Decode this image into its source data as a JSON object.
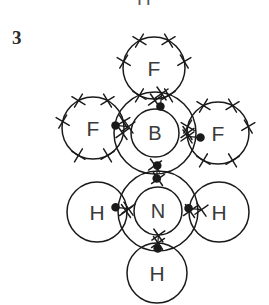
{
  "figure": {
    "kind": "dot-and-cross-diagram",
    "molecule_label": "F3B-NH3 adduct",
    "question_number": "3",
    "clipped_label_above": "H",
    "stroke_color": "#1a1a1a",
    "text_color": "#3a3a3a",
    "background_color": "#ffffff",
    "atoms": [
      {
        "id": "f-top",
        "symbol": "F",
        "cx": 154,
        "cy": 68,
        "r": 31,
        "electron_marker": "cross",
        "outer_cross_count": 6,
        "has_inner_shell": false,
        "bonded_to": [
          "b-center"
        ]
      },
      {
        "id": "f-left",
        "symbol": "F",
        "cx": 93,
        "cy": 128,
        "r": 31,
        "electron_marker": "cross",
        "outer_cross_count": 6,
        "has_inner_shell": false,
        "bonded_to": [
          "b-center"
        ]
      },
      {
        "id": "b-center",
        "symbol": "B",
        "cx": 155,
        "cy": 133,
        "r": 41,
        "inner_r": 24,
        "electron_marker": "cross",
        "outer_cross_count": 4,
        "has_inner_shell": true,
        "bonded_to": [
          "f-top",
          "f-left",
          "f-right",
          "n-center"
        ]
      },
      {
        "id": "f-right",
        "symbol": "F",
        "cx": 218,
        "cy": 133,
        "r": 31,
        "electron_marker": "cross",
        "outer_cross_count": 6,
        "has_inner_shell": false,
        "bonded_to": [
          "b-center"
        ]
      },
      {
        "id": "h-left",
        "symbol": "H",
        "cx": 97,
        "cy": 212,
        "r": 30,
        "electron_marker": "dot",
        "outer_cross_count": 0,
        "has_inner_shell": false,
        "bonded_to": [
          "n-center"
        ]
      },
      {
        "id": "n-center",
        "symbol": "N",
        "cx": 158,
        "cy": 211,
        "r": 40,
        "inner_r": 24,
        "electron_marker": "cross",
        "outer_cross_count": 4,
        "has_inner_shell": true,
        "bonded_to": [
          "b-center",
          "h-left",
          "h-right",
          "h-bottom"
        ]
      },
      {
        "id": "h-right",
        "symbol": "H",
        "cx": 219,
        "cy": 212,
        "r": 30,
        "electron_marker": "dot",
        "outer_cross_count": 0,
        "has_inner_shell": false,
        "bonded_to": [
          "n-center"
        ]
      },
      {
        "id": "h-bottom",
        "symbol": "H",
        "cx": 157,
        "cy": 273,
        "r": 30,
        "electron_marker": "dot",
        "outer_cross_count": 0,
        "has_inner_shell": false,
        "bonded_to": [
          "n-center"
        ]
      }
    ],
    "bonds": [
      {
        "id": "bond-b-f-top",
        "from": "b-center",
        "to": "f-top",
        "x": 161,
        "y": 100,
        "angle": 95,
        "left_marker": "cross",
        "right_marker": "dot"
      },
      {
        "id": "bond-b-f-left",
        "from": "b-center",
        "to": "f-left",
        "x": 122,
        "y": 126,
        "angle": 5,
        "left_marker": "dot",
        "right_marker": "cross"
      },
      {
        "id": "bond-b-f-right",
        "from": "b-center",
        "to": "f-right",
        "x": 194,
        "y": 137,
        "angle": 5,
        "left_marker": "cross",
        "right_marker": "dot"
      },
      {
        "id": "bond-b-n",
        "from": "n-center",
        "to": "b-center",
        "x": 157,
        "y": 172,
        "angle": 92,
        "left_marker": "dot",
        "right_marker": "dot"
      },
      {
        "id": "bond-n-h-left",
        "from": "n-center",
        "to": "h-left",
        "x": 122,
        "y": 208,
        "angle": 6,
        "left_marker": "dot",
        "right_marker": "cross"
      },
      {
        "id": "bond-n-h-right",
        "from": "n-center",
        "to": "h-right",
        "x": 195,
        "y": 209,
        "angle": 6,
        "left_marker": "dot",
        "right_marker": "cross"
      },
      {
        "id": "bond-n-h-bottom",
        "from": "n-center",
        "to": "h-bottom",
        "x": 158,
        "y": 242,
        "angle": 93,
        "left_marker": "cross",
        "right_marker": "dot"
      }
    ]
  }
}
